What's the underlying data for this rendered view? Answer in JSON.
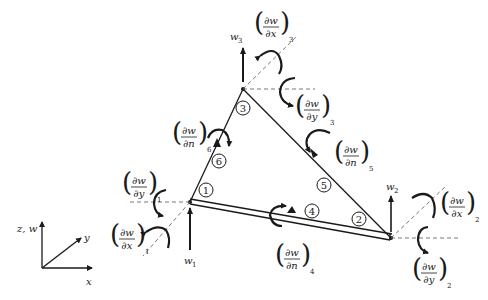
{
  "diagram": {
    "type": "triangular plate bending element with 12 degrees of freedom",
    "nodes": [
      {
        "id": "1",
        "x": 190,
        "y": 202
      },
      {
        "id": "2",
        "x": 391,
        "y": 238
      },
      {
        "id": "3",
        "x": 243,
        "y": 89
      }
    ],
    "midside_nodes": [
      {
        "id": "4",
        "x": 290,
        "y": 213
      },
      {
        "id": "5",
        "x": 322,
        "y": 157
      },
      {
        "id": "6",
        "x": 215,
        "y": 143
      }
    ],
    "node_labels": {
      "n1": "1",
      "n2": "2",
      "n3": "3",
      "n4": "4",
      "n5": "5",
      "n6": "6"
    },
    "displacement_labels": {
      "w1": {
        "base": "w",
        "sub": "1"
      },
      "w2": {
        "base": "w",
        "sub": "2"
      },
      "w3": {
        "base": "w",
        "sub": "3"
      }
    },
    "rotation_labels": {
      "dwdx1": {
        "num": "∂w",
        "den": "∂x",
        "sub": "1"
      },
      "dwdy1": {
        "num": "∂w",
        "den": "∂y",
        "sub": "1"
      },
      "dwdx2": {
        "num": "∂w",
        "den": "∂x",
        "sub": "2"
      },
      "dwdy2": {
        "num": "∂w",
        "den": "∂y",
        "sub": "2"
      },
      "dwdx3": {
        "num": "∂w",
        "den": "∂x",
        "sub": "3"
      },
      "dwdy3": {
        "num": "∂w",
        "den": "∂y",
        "sub": "3"
      },
      "dwdn4": {
        "num": "∂w",
        "den": "∂n",
        "sub": "4"
      },
      "dwdn5": {
        "num": "∂w",
        "den": "∂n",
        "sub": "5"
      },
      "dwdn6": {
        "num": "∂w",
        "den": "∂n",
        "sub": "6"
      }
    },
    "axes": {
      "vertical": "z, w",
      "horizontal": "x",
      "diagonal": "y"
    },
    "colors": {
      "ink": "#1a1a1a",
      "background": "#ffffff",
      "dashed": "#555555"
    }
  }
}
